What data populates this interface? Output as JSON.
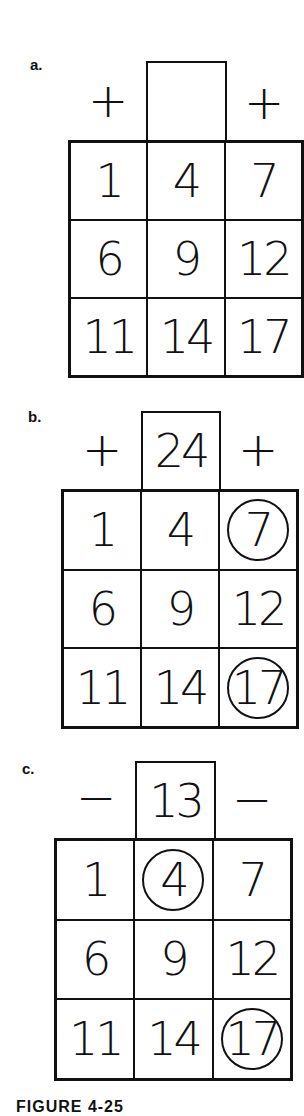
{
  "panels": [
    {
      "label": "a.",
      "left_op": "+",
      "right_op": "+",
      "target": "",
      "cells": [
        "1",
        "4",
        "7",
        "6",
        "9",
        "12",
        "11",
        "14",
        "17"
      ],
      "circled": []
    },
    {
      "label": "b.",
      "left_op": "+",
      "right_op": "+",
      "target": "24",
      "cells": [
        "1",
        "4",
        "7",
        "6",
        "9",
        "12",
        "11",
        "14",
        "17"
      ],
      "circled": [
        2,
        8
      ]
    },
    {
      "label": "c.",
      "left_op": "−",
      "right_op": "−",
      "target": "13",
      "cells": [
        "1",
        "4",
        "7",
        "6",
        "9",
        "12",
        "11",
        "14",
        "17"
      ],
      "circled": [
        1,
        8
      ]
    }
  ],
  "caption": "FIGURE 4-25"
}
